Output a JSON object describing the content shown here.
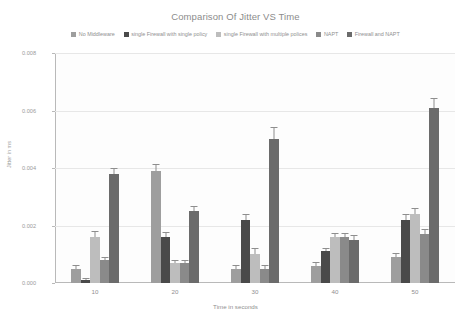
{
  "chart_data": {
    "type": "bar",
    "title": "Comparison Of Jitter VS Time",
    "xlabel": "Time in seconds",
    "ylabel": "Jitter in ms",
    "categories": [
      "10",
      "20",
      "30",
      "40",
      "50"
    ],
    "ylim": [
      0,
      0.008
    ],
    "yticks": [
      "0.008",
      "0.006",
      "0.004",
      "0.002",
      "0.000"
    ],
    "ytick_values": [
      0.008,
      0.006,
      0.004,
      0.002,
      0.0
    ],
    "grid": true,
    "legend_position": "top",
    "error_bars": true,
    "series": [
      {
        "name": "No Middleware",
        "color": "#9e9e9e",
        "values": [
          0.0005,
          0.0039,
          0.0005,
          0.0006,
          0.0009
        ],
        "errors": [
          8e-05,
          0.00022,
          8e-05,
          8e-05,
          0.0001
        ]
      },
      {
        "name": "single Firewall with single policy",
        "color": "#4a4a4a",
        "values": [
          0.0001,
          0.0016,
          0.0022,
          0.0011,
          0.0022
        ],
        "errors": [
          4e-05,
          0.00015,
          0.00015,
          0.0001,
          0.00015
        ]
      },
      {
        "name": "single Firewall with multiple polices",
        "color": "#bdbdbd",
        "values": [
          0.0016,
          0.0007,
          0.001,
          0.0016,
          0.0024
        ],
        "errors": [
          0.00018,
          8e-05,
          0.00018,
          0.00012,
          0.00018
        ]
      },
      {
        "name": "NAPT",
        "color": "#8a8a8a",
        "values": [
          0.0008,
          0.0007,
          0.0005,
          0.0016,
          0.0017
        ],
        "errors": [
          8e-05,
          8e-05,
          8e-05,
          0.00012,
          0.00014
        ]
      },
      {
        "name": "Firewall and NAPT",
        "color": "#6b6b6b",
        "values": [
          0.0038,
          0.0025,
          0.005,
          0.0015,
          0.0061
        ],
        "errors": [
          0.00015,
          0.00015,
          0.00038,
          0.00012,
          0.0003
        ]
      }
    ]
  }
}
